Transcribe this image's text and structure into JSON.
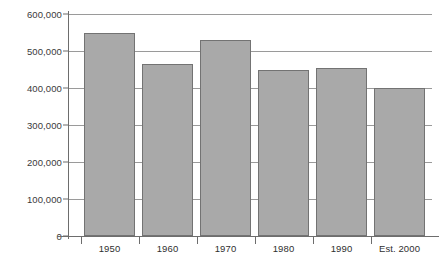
{
  "chart_data": {
    "type": "bar",
    "title": "",
    "subtitle": "",
    "xlabel": "",
    "ylabel": "",
    "categories": [
      "1950",
      "1960",
      "1970",
      "1980",
      "1990",
      "Est. 2000"
    ],
    "values": [
      550000,
      465000,
      530000,
      450000,
      455000,
      400000
    ],
    "ylim": [
      0,
      600000
    ],
    "ytick_labels": [
      "0",
      "100,000",
      "200,000",
      "300,000",
      "400,000",
      "500,000",
      "600,000"
    ],
    "ytick_values": [
      0,
      100000,
      200000,
      300000,
      400000,
      500000,
      600000
    ],
    "grid": true,
    "legend": false,
    "legend_position": "none",
    "series": [
      {
        "name": "",
        "values": [
          550000,
          465000,
          530000,
          450000,
          455000,
          400000
        ]
      }
    ],
    "colors": {
      "bar_fill": "#a9a9a9",
      "bar_border": "#737373",
      "gridline": "#9a9a9a",
      "axis": "#6d6d6d",
      "label_text": "#2f2f2f",
      "background": "#ffffff"
    }
  }
}
